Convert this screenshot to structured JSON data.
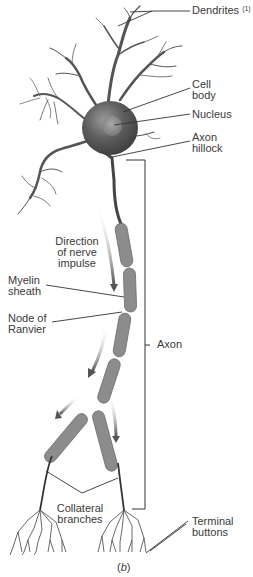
{
  "figure": {
    "caption_prefix": "(",
    "caption_letter": "b",
    "caption_suffix": ")"
  },
  "labels": {
    "dendrites": "Dendrites",
    "dendrites_note": "(1)",
    "cell_body_1": "Cell",
    "cell_body_2": "body",
    "nucleus": "Nucleus",
    "axon_hillock_1": "Axon",
    "axon_hillock_2": "hillock",
    "direction_1": "Direction",
    "direction_2": "of nerve",
    "direction_3": "impulse",
    "myelin_1": "Myelin",
    "myelin_2": "sheath",
    "node_1": "Node of",
    "node_2": "Ranvier",
    "axon": "Axon",
    "collateral_1": "Collateral",
    "collateral_2": "branches",
    "terminal_1": "Terminal",
    "terminal_2": "buttons"
  },
  "colors": {
    "cell_body": "#5a5a5a",
    "nucleus": "#8a8a8a",
    "myelin": "#8c8c8c",
    "dendrite": "#555555",
    "leader_line": "#333333",
    "arrow": "#6a6a6a"
  }
}
